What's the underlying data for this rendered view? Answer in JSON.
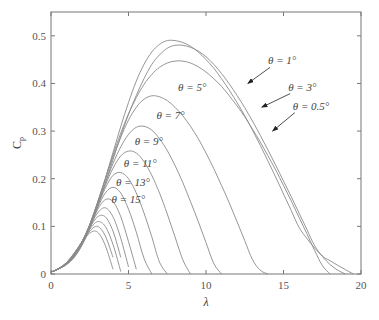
{
  "chart_data": {
    "type": "line",
    "title": "",
    "xlabel": "λ",
    "ylabel": "Cp",
    "xlim": [
      0,
      20
    ],
    "ylim": [
      0,
      0.55
    ],
    "xticks": [
      0,
      5,
      10,
      15,
      20
    ],
    "yticks": [
      0,
      0.1,
      0.2,
      0.3,
      0.4,
      0.5
    ],
    "xtick_labels": [
      "0",
      "5",
      "10",
      "15",
      "20"
    ],
    "ytick_labels": [
      "0",
      "0.1",
      "0.2",
      "0.3",
      "0.4",
      "0.5"
    ],
    "grid": false,
    "legend": "none (inline annotations)",
    "x": [
      0,
      0.5,
      1,
      1.5,
      2,
      2.5,
      3,
      3.5,
      4,
      4.5,
      5,
      5.5,
      6,
      6.5,
      7,
      7.5,
      8,
      8.5,
      9,
      9.5,
      10,
      10.5,
      11,
      11.5,
      12,
      12.5,
      13,
      13.5,
      14,
      14.5,
      15,
      15.5,
      16,
      16.5,
      17,
      17.5,
      18,
      18.5,
      19,
      19.5,
      20
    ],
    "series": [
      {
        "name": "θ=0.5°",
        "theta": 0.5,
        "values": [
          0.004,
          0.011,
          0.02,
          0.035,
          0.06,
          0.095,
          0.14,
          0.19,
          0.24,
          0.29,
          0.335,
          0.375,
          0.41,
          0.44,
          0.46,
          0.474,
          0.48,
          0.48,
          0.476,
          0.468,
          0.456,
          0.44,
          0.421,
          0.399,
          0.375,
          0.349,
          0.321,
          0.291,
          0.26,
          0.228,
          0.195,
          0.162,
          0.128,
          0.094,
          0.06,
          0.038,
          0.028,
          0.018,
          0.009,
          0.0,
          null
        ]
      },
      {
        "name": "θ=1°",
        "theta": 1,
        "values": [
          0.004,
          0.011,
          0.02,
          0.036,
          0.062,
          0.1,
          0.148,
          0.2,
          0.255,
          0.31,
          0.36,
          0.405,
          0.44,
          0.466,
          0.482,
          0.49,
          0.49,
          0.486,
          0.478,
          0.466,
          0.45,
          0.432,
          0.41,
          0.386,
          0.36,
          0.332,
          0.302,
          0.27,
          0.237,
          0.203,
          0.168,
          0.133,
          0.098,
          0.075,
          0.055,
          0.037,
          0.02,
          0.008,
          0.0,
          null,
          null
        ]
      },
      {
        "name": "θ=3°",
        "theta": 3,
        "values": [
          0.004,
          0.011,
          0.02,
          0.037,
          0.064,
          0.102,
          0.15,
          0.2,
          0.25,
          0.296,
          0.336,
          0.37,
          0.398,
          0.419,
          0.434,
          0.443,
          0.447,
          0.447,
          0.443,
          0.435,
          0.424,
          0.41,
          0.394,
          0.374,
          0.353,
          0.33,
          0.304,
          0.277,
          0.248,
          0.218,
          0.186,
          0.153,
          0.119,
          0.085,
          0.05,
          0.018,
          0.0,
          null,
          null,
          null,
          null
        ]
      },
      {
        "name": "θ=5°",
        "theta": 5,
        "values": [
          0.004,
          0.011,
          0.021,
          0.038,
          0.065,
          0.104,
          0.15,
          0.198,
          0.245,
          0.287,
          0.323,
          0.35,
          0.367,
          0.374,
          0.372,
          0.364,
          0.35,
          0.332,
          0.31,
          0.284,
          0.254,
          0.221,
          0.186,
          0.149,
          0.11,
          0.07,
          0.03,
          0.008,
          0.0,
          null,
          null,
          null,
          null,
          null,
          null,
          null,
          null,
          null,
          null,
          null,
          null
        ]
      },
      {
        "name": "θ=7°",
        "theta": 7,
        "values": [
          0.004,
          0.011,
          0.021,
          0.039,
          0.066,
          0.104,
          0.148,
          0.19,
          0.232,
          0.267,
          0.293,
          0.308,
          0.31,
          0.302,
          0.284,
          0.259,
          0.228,
          0.192,
          0.152,
          0.11,
          0.066,
          0.022,
          0.0,
          null,
          null,
          null,
          null,
          null,
          null,
          null,
          null,
          null,
          null,
          null,
          null,
          null,
          null,
          null,
          null,
          null,
          null
        ]
      },
      {
        "name": "θ=9°",
        "theta": 9,
        "values": [
          0.004,
          0.011,
          0.022,
          0.04,
          0.067,
          0.104,
          0.145,
          0.186,
          0.222,
          0.248,
          0.258,
          0.254,
          0.236,
          0.207,
          0.17,
          0.126,
          0.078,
          0.03,
          0.0,
          null,
          null,
          null,
          null,
          null,
          null,
          null,
          null,
          null,
          null,
          null,
          null,
          null,
          null,
          null,
          null,
          null,
          null,
          null,
          null,
          null,
          null
        ]
      },
      {
        "name": "θ=11°",
        "theta": 11,
        "values": [
          0.004,
          0.011,
          0.022,
          0.04,
          0.068,
          0.103,
          0.142,
          0.18,
          0.207,
          0.213,
          0.2,
          0.17,
          0.128,
          0.078,
          0.025,
          0.0,
          null,
          null,
          null,
          null,
          null,
          null,
          null,
          null,
          null,
          null,
          null,
          null,
          null,
          null,
          null,
          null,
          null,
          null,
          null,
          null,
          null,
          null,
          null,
          null,
          null
        ]
      },
      {
        "name": "θ=13°",
        "theta": 13,
        "values": [
          0.004,
          0.011,
          0.022,
          0.041,
          0.068,
          0.102,
          0.139,
          0.17,
          0.182,
          0.17,
          0.136,
          0.088,
          0.033,
          0.0,
          null,
          null,
          null,
          null,
          null,
          null,
          null,
          null,
          null,
          null,
          null,
          null,
          null,
          null,
          null,
          null,
          null,
          null,
          null,
          null,
          null,
          null,
          null,
          null,
          null,
          null,
          null
        ]
      },
      {
        "name": "θ=15°",
        "theta": 15,
        "values": [
          0.004,
          0.011,
          0.023,
          0.042,
          0.068,
          0.101,
          0.135,
          0.156,
          0.152,
          0.12,
          0.068,
          0.01,
          null,
          null,
          null,
          null,
          null,
          null,
          null,
          null,
          null,
          null,
          null,
          null,
          null,
          null,
          null,
          null,
          null,
          null,
          null,
          null,
          null,
          null,
          null,
          null,
          null,
          null,
          null,
          null,
          null
        ]
      },
      {
        "name": "θ=17°",
        "theta": 17,
        "values": [
          0.004,
          0.011,
          0.023,
          0.042,
          0.068,
          0.099,
          0.128,
          0.139,
          0.12,
          0.075,
          0.015,
          null,
          null,
          null,
          null,
          null,
          null,
          null,
          null,
          null,
          null,
          null,
          null,
          null,
          null,
          null,
          null,
          null,
          null,
          null,
          null,
          null,
          null,
          null,
          null,
          null,
          null,
          null,
          null,
          null,
          null
        ]
      },
      {
        "name": "θ=19°",
        "theta": 19,
        "values": [
          0.004,
          0.011,
          0.023,
          0.043,
          0.068,
          0.097,
          0.12,
          0.12,
          0.09,
          0.035,
          null,
          null,
          null,
          null,
          null,
          null,
          null,
          null,
          null,
          null,
          null,
          null,
          null,
          null,
          null,
          null,
          null,
          null,
          null,
          null,
          null,
          null,
          null,
          null,
          null,
          null,
          null,
          null,
          null,
          null,
          null
        ]
      },
      {
        "name": "θ=21°",
        "theta": 21,
        "values": [
          0.004,
          0.011,
          0.024,
          0.043,
          0.068,
          0.094,
          0.11,
          0.1,
          0.062,
          0.005,
          null,
          null,
          null,
          null,
          null,
          null,
          null,
          null,
          null,
          null,
          null,
          null,
          null,
          null,
          null,
          null,
          null,
          null,
          null,
          null,
          null,
          null,
          null,
          null,
          null,
          null,
          null,
          null,
          null,
          null,
          null
        ]
      },
      {
        "name": "θ=23°",
        "theta": 23,
        "values": [
          0.004,
          0.012,
          0.024,
          0.044,
          0.067,
          0.09,
          0.1,
          0.08,
          0.035,
          null,
          null,
          null,
          null,
          null,
          null,
          null,
          null,
          null,
          null,
          null,
          null,
          null,
          null,
          null,
          null,
          null,
          null,
          null,
          null,
          null,
          null,
          null,
          null,
          null,
          null,
          null,
          null,
          null,
          null,
          null,
          null
        ]
      },
      {
        "name": "θ=25°",
        "theta": 25,
        "values": [
          0.004,
          0.012,
          0.024,
          0.044,
          0.066,
          0.086,
          0.088,
          0.06,
          0.01,
          null,
          null,
          null,
          null,
          null,
          null,
          null,
          null,
          null,
          null,
          null,
          null,
          null,
          null,
          null,
          null,
          null,
          null,
          null,
          null,
          null,
          null,
          null,
          null,
          null,
          null,
          null,
          null,
          null,
          null,
          null,
          null
        ]
      }
    ],
    "annotations": [
      {
        "text": "θ = 1°",
        "x": 14.0,
        "y": 0.44,
        "arrow_to": [
          12.7,
          0.4
        ]
      },
      {
        "text": "θ = 3°",
        "x": 15.3,
        "y": 0.385,
        "arrow_to": [
          13.6,
          0.35
        ]
      },
      {
        "text": "θ = 0.5°",
        "x": 15.6,
        "y": 0.345,
        "arrow_to": [
          14.3,
          0.3
        ]
      },
      {
        "text": "θ = 5°",
        "x": 8.2,
        "y": 0.385
      },
      {
        "text": "θ = 7°",
        "x": 6.8,
        "y": 0.325
      },
      {
        "text": "θ = 9°",
        "x": 5.4,
        "y": 0.27
      },
      {
        "text": "θ = 11°",
        "x": 4.7,
        "y": 0.225
      },
      {
        "text": "θ = 13°",
        "x": 4.2,
        "y": 0.185
      },
      {
        "text": "θ = 15°",
        "x": 3.9,
        "y": 0.148
      }
    ]
  },
  "plot": {
    "left": 51,
    "right": 361,
    "top": 12,
    "bottom": 274,
    "line_color": "#8a8a8a",
    "axis_color": "#777777",
    "text_color": "#555555"
  }
}
